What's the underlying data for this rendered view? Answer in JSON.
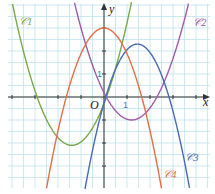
{
  "chart_data": {
    "type": "line",
    "title": "",
    "xlabel": "x",
    "ylabel": "y",
    "origin_label": "O",
    "tick_labels": {
      "x_unit": "1",
      "y_unit": "1"
    },
    "grid": true,
    "xlim": [
      -4.5,
      4.6
    ],
    "ylim": [
      -4.2,
      4.2
    ],
    "axes_colors": {
      "grid": "#bfe3ee",
      "axis": "#333333"
    },
    "series": [
      {
        "name": "C1",
        "label": "𝒞1",
        "color": "#7aa84a",
        "shape": "parabola opening upward",
        "vertex": [
          -1.4,
          -2.1
        ],
        "points": [
          [
            -4.0,
            4.0
          ],
          [
            -3.0,
            0.0
          ],
          [
            -2.2,
            -1.6
          ],
          [
            -1.4,
            -2.1
          ],
          [
            -0.6,
            -1.6
          ],
          [
            0.0,
            -0.4
          ],
          [
            0.6,
            1.6
          ],
          [
            1.1,
            4.0
          ]
        ]
      },
      {
        "name": "C2",
        "label": "𝒞2",
        "color": "#a05aa8",
        "shape": "parabola opening upward",
        "vertex": [
          1.2,
          -1.0
        ],
        "points": [
          [
            -0.1,
            0.3
          ],
          [
            0.0,
            0.0
          ],
          [
            0.6,
            -0.75
          ],
          [
            1.2,
            -1.0
          ],
          [
            1.8,
            -0.75
          ],
          [
            2.5,
            0.0
          ],
          [
            3.0,
            1.6
          ],
          [
            3.6,
            4.0
          ]
        ]
      },
      {
        "name": "C3",
        "label": "𝒞3",
        "color": "#4a6ab0",
        "shape": "parabola opening downward",
        "vertex": [
          1.45,
          2.3
        ],
        "points": [
          [
            -0.4,
            -3.8
          ],
          [
            0.0,
            0.0
          ],
          [
            0.5,
            1.5
          ],
          [
            1.45,
            2.3
          ],
          [
            2.2,
            1.6
          ],
          [
            2.9,
            0.0
          ],
          [
            3.4,
            -2.2
          ],
          [
            3.9,
            -4.2
          ]
        ]
      },
      {
        "name": "C4",
        "label": "𝒞4",
        "color": "#e07048",
        "shape": "parabola opening downward",
        "vertex": [
          0.0,
          3.0
        ],
        "points": [
          [
            -2.4,
            -4.2
          ],
          [
            -1.8,
            0.0
          ],
          [
            -1.0,
            2.1
          ],
          [
            0.0,
            3.0
          ],
          [
            1.0,
            2.1
          ],
          [
            1.6,
            0.0
          ],
          [
            2.2,
            -2.4
          ],
          [
            2.6,
            -4.2
          ]
        ]
      }
    ]
  }
}
